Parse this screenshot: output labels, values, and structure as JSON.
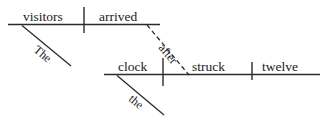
{
  "diagram": {
    "kind": "reed-kellogg-sentence-diagram",
    "sentence": "The visitors arrived after the clock struck twelve.",
    "background_color": "#ffffff",
    "ink_color": "#2b2b2b",
    "text_color": "#1a1a1a",
    "main_clause": {
      "subject": "visitors",
      "subject_modifier": "The",
      "verb": "arrived"
    },
    "subordinate_clause": {
      "subject": "clock",
      "subject_modifier": "the",
      "verb": "struck",
      "object": "twelve"
    },
    "connector": {
      "label": "after",
      "style": "dashed"
    }
  }
}
